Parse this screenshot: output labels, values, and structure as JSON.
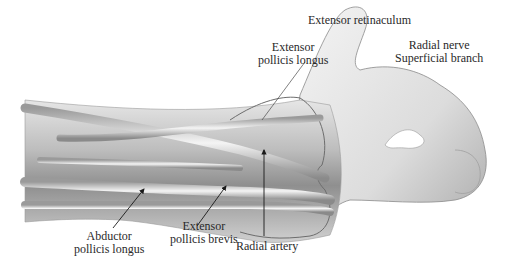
{
  "figure": {
    "labels": {
      "extensor_retinaculum": {
        "lines": [
          "Extensor retinaculum"
        ]
      },
      "extensor_pollicis_longus": {
        "lines": [
          "Extensor",
          "pollicis longus"
        ]
      },
      "radial_nerve": {
        "lines": [
          "Radial nerve",
          "Superficial branch"
        ]
      },
      "abductor_pollicis_longus": {
        "lines": [
          "Abductor",
          "pollicis longus"
        ]
      },
      "extensor_pollicis_brevis": {
        "lines": [
          "Extensor",
          "pollicis brevis"
        ]
      },
      "radial_artery": {
        "lines": [
          "Radial artery"
        ]
      }
    },
    "colors": {
      "background": "#ffffff",
      "text": "#2a2a2a",
      "leader": "#1a1a1a",
      "skin_light": "#f2f2f2",
      "skin_mid": "#c8c8c8",
      "skin_dark": "#7a7a7a"
    }
  }
}
